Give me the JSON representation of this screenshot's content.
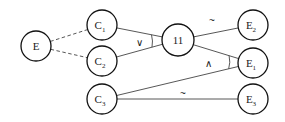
{
  "diagram": {
    "nodes": [
      {
        "id": "E",
        "label": "E",
        "sub": "",
        "cx": 36,
        "cy": 46,
        "r": 15
      },
      {
        "id": "C1",
        "label": "C",
        "sub": "1",
        "cx": 102,
        "cy": 25,
        "r": 15
      },
      {
        "id": "C2",
        "label": "C",
        "sub": "2",
        "cx": 102,
        "cy": 61,
        "r": 15
      },
      {
        "id": "C3",
        "label": "C",
        "sub": "3",
        "cx": 102,
        "cy": 99,
        "r": 15
      },
      {
        "id": "N11",
        "label": "11",
        "sub": "",
        "cx": 178,
        "cy": 40,
        "r": 16
      },
      {
        "id": "E2",
        "label": "E",
        "sub": "2",
        "cx": 253,
        "cy": 25,
        "r": 15
      },
      {
        "id": "E1",
        "label": "E",
        "sub": "1",
        "cx": 253,
        "cy": 63,
        "r": 15
      },
      {
        "id": "E3",
        "label": "E",
        "sub": "3",
        "cx": 253,
        "cy": 99,
        "r": 15
      }
    ],
    "edges": [
      {
        "from": "E",
        "to": "C1",
        "style": "dashed"
      },
      {
        "from": "E",
        "to": "C2",
        "style": "dashed"
      },
      {
        "from": "C1",
        "to": "N11",
        "style": "solid"
      },
      {
        "from": "C2",
        "to": "N11",
        "style": "solid"
      },
      {
        "from": "N11",
        "to": "E2",
        "style": "solid",
        "label": "~"
      },
      {
        "from": "N11",
        "to": "E1",
        "style": "solid"
      },
      {
        "from": "C3",
        "to": "E1",
        "style": "solid"
      },
      {
        "from": "C3",
        "to": "E3",
        "style": "solid",
        "label": "~"
      }
    ],
    "operators": [
      {
        "symbol": "∨",
        "at": "N11",
        "x": 139,
        "y": 46
      },
      {
        "symbol": "∧",
        "at": "E1",
        "x": 208,
        "y": 67
      }
    ],
    "edge_labels": [
      {
        "text": "~",
        "x": 212,
        "y": 24
      },
      {
        "text": "~",
        "x": 183,
        "y": 97
      }
    ]
  }
}
